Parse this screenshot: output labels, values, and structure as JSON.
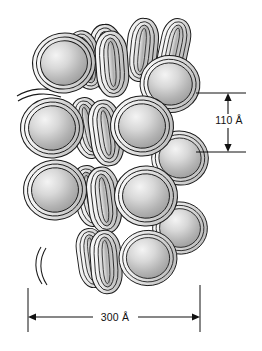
{
  "figure": {
    "background_color": "#ffffff",
    "outline_color": "#1a1a1a",
    "core_fill_light": "#f2f2f2",
    "core_fill_mid": "#bdbdbd",
    "core_fill_dark": "#9a9a9a",
    "dna_ribbon_light": "#fafafa",
    "dna_ribbon_shade": "#c9c9c9"
  },
  "dimensions": {
    "vertical": {
      "label": "110 Å",
      "value": 110,
      "unit": "Å",
      "orientation": "vertical",
      "arrow_style": "double-headed"
    },
    "horizontal": {
      "label": "300 Å",
      "value": 300,
      "unit": "Å",
      "orientation": "horizontal",
      "arrow_style": "double-headed"
    }
  },
  "structure": {
    "face_on_nucleosomes": [
      {
        "cx": 64,
        "cy": 63,
        "rx": 30,
        "ry": 28,
        "rot": -10
      },
      {
        "cx": 168,
        "cy": 82,
        "rx": 29,
        "ry": 27,
        "rot": 8
      },
      {
        "cx": 52,
        "cy": 128,
        "rx": 30,
        "ry": 28,
        "rot": -4
      },
      {
        "cx": 140,
        "cy": 126,
        "rx": 29,
        "ry": 29,
        "rot": 4
      },
      {
        "cx": 179,
        "cy": 158,
        "rx": 27,
        "ry": 26,
        "rot": 10
      },
      {
        "cx": 55,
        "cy": 190,
        "rx": 30,
        "ry": 29,
        "rot": -6
      },
      {
        "cx": 145,
        "cy": 196,
        "rx": 28,
        "ry": 30,
        "rot": 3
      },
      {
        "cx": 179,
        "cy": 228,
        "rx": 26,
        "ry": 26,
        "rot": 9
      },
      {
        "cx": 147,
        "cy": 258,
        "rx": 26,
        "ry": 28,
        "rot": 2
      }
    ],
    "edge_on_nucleosomes": [
      {
        "cx": 107,
        "cy": 58,
        "rx": 16,
        "ry": 33,
        "rot": -6
      },
      {
        "cx": 143,
        "cy": 52,
        "rx": 15,
        "ry": 31,
        "rot": 5
      },
      {
        "cx": 106,
        "cy": 131,
        "rx": 17,
        "ry": 33,
        "rot": -8
      },
      {
        "cx": 104,
        "cy": 198,
        "rx": 17,
        "ry": 33,
        "rot": -7
      },
      {
        "cx": 107,
        "cy": 260,
        "rx": 16,
        "ry": 31,
        "rot": -4
      }
    ],
    "linker_dna": [
      {
        "id": "upper-left-linker",
        "path": "M 18 95 C 30 90 44 90 56 94"
      },
      {
        "id": "lower-left-linker",
        "path": "M 78 282 C 66 274 60 260 62 246"
      }
    ],
    "coil_count_per_nucleosome": 3
  },
  "annotations": {
    "icon_names": [
      "nucleosome-core-icon",
      "dna-coil-icon",
      "dimension-arrow-icon"
    ]
  }
}
